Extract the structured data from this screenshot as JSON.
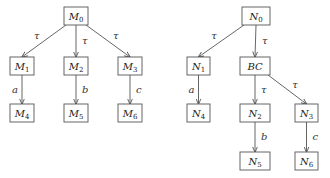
{
  "left_tree": {
    "nodes": [
      {
        "id": "M0",
        "base": "M",
        "sub": "0",
        "x": 64,
        "y": 7,
        "w": 24,
        "h": 18
      },
      {
        "id": "M1",
        "base": "M",
        "sub": "1",
        "x": 10,
        "y": 57,
        "w": 24,
        "h": 18
      },
      {
        "id": "M2",
        "base": "M",
        "sub": "2",
        "x": 64,
        "y": 57,
        "w": 24,
        "h": 18
      },
      {
        "id": "M3",
        "base": "M",
        "sub": "3",
        "x": 118,
        "y": 57,
        "w": 24,
        "h": 18
      },
      {
        "id": "M4",
        "base": "M",
        "sub": "4",
        "x": 10,
        "y": 104,
        "w": 24,
        "h": 18
      },
      {
        "id": "M5",
        "base": "M",
        "sub": "5",
        "x": 64,
        "y": 104,
        "w": 24,
        "h": 18
      },
      {
        "id": "M6",
        "base": "M",
        "sub": "6",
        "x": 118,
        "y": 104,
        "w": 24,
        "h": 18
      }
    ],
    "edges": [
      {
        "from": "M0",
        "to": "M1",
        "label": "τ"
      },
      {
        "from": "M0",
        "to": "M2",
        "label": "τ"
      },
      {
        "from": "M0",
        "to": "M3",
        "label": "τ"
      },
      {
        "from": "M1",
        "to": "M4",
        "label": "a"
      },
      {
        "from": "M2",
        "to": "M5",
        "label": "b"
      },
      {
        "from": "M3",
        "to": "M6",
        "label": "c"
      }
    ]
  },
  "right_tree": {
    "nodes": [
      {
        "id": "N0",
        "base": "N",
        "sub": "0",
        "x": 242,
        "y": 7,
        "w": 28,
        "h": 18
      },
      {
        "id": "N1",
        "base": "N",
        "sub": "1",
        "x": 187,
        "y": 57,
        "w": 23,
        "h": 18
      },
      {
        "id": "BC",
        "base": "BC",
        "sub": "",
        "x": 240,
        "y": 57,
        "w": 30,
        "h": 18
      },
      {
        "id": "N4",
        "base": "N",
        "sub": "4",
        "x": 187,
        "y": 104,
        "w": 23,
        "h": 18
      },
      {
        "id": "N2",
        "base": "N",
        "sub": "2",
        "x": 240,
        "y": 104,
        "w": 30,
        "h": 18
      },
      {
        "id": "N3",
        "base": "N",
        "sub": "3",
        "x": 295,
        "y": 104,
        "w": 23,
        "h": 18
      },
      {
        "id": "N5",
        "base": "N",
        "sub": "5",
        "x": 240,
        "y": 152,
        "w": 30,
        "h": 18
      },
      {
        "id": "N6",
        "base": "N",
        "sub": "6",
        "x": 295,
        "y": 152,
        "w": 23,
        "h": 18
      }
    ],
    "edges": [
      {
        "from": "N0",
        "to": "N1",
        "label": "τ"
      },
      {
        "from": "N0",
        "to": "BC",
        "label": "τ"
      },
      {
        "from": "N1",
        "to": "N4",
        "label": "a"
      },
      {
        "from": "BC",
        "to": "N2",
        "label": "τ"
      },
      {
        "from": "BC",
        "to": "N3",
        "label": "τ"
      },
      {
        "from": "N2",
        "to": "N5",
        "label": "b"
      },
      {
        "from": "N3",
        "to": "N6",
        "label": "c"
      }
    ]
  }
}
